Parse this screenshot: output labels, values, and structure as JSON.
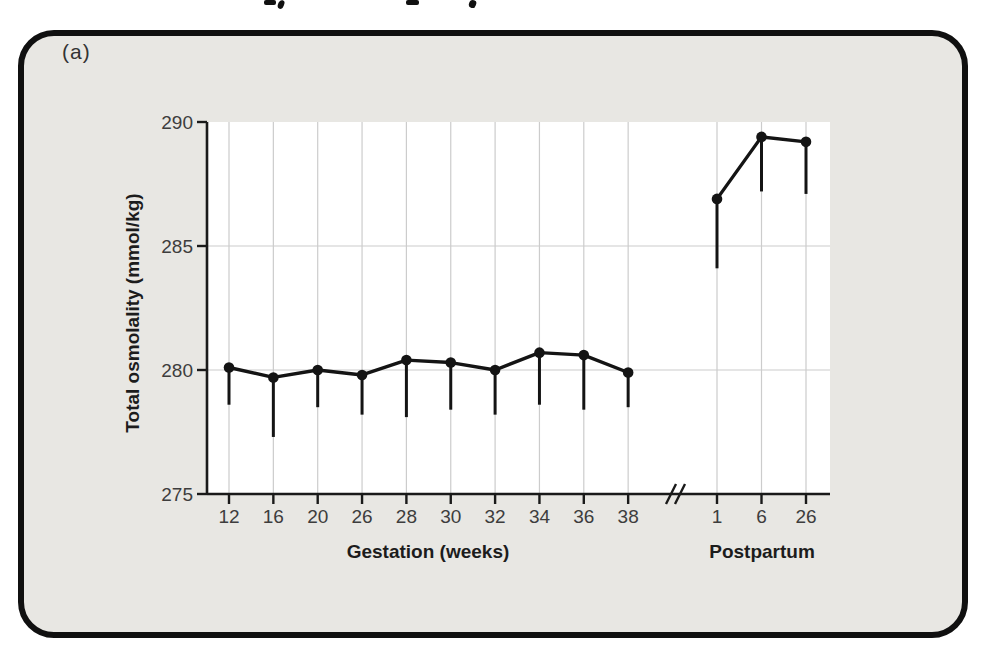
{
  "figure": {
    "panel_label": "(a)"
  },
  "chart_data": {
    "type": "line",
    "title": "",
    "ylabel": "Total osmolality (mmol/kg)",
    "ylim": [
      275,
      290
    ],
    "yticks": [
      290,
      285,
      280,
      275
    ],
    "grid_y": [
      285,
      280
    ],
    "grid_vertical": true,
    "legend": false,
    "axis_break_between_sections": true,
    "error_bars": "lower only, no caps",
    "sections": [
      {
        "name": "gestation",
        "xlabel": "Gestation (weeks)",
        "categories": [
          "12",
          "16",
          "20",
          "26",
          "28",
          "30",
          "32",
          "34",
          "36",
          "38"
        ],
        "values": [
          280.1,
          279.7,
          280.0,
          279.8,
          280.4,
          280.3,
          280.0,
          280.7,
          280.6,
          279.9
        ],
        "error_low": [
          278.6,
          277.3,
          278.5,
          278.2,
          278.1,
          278.4,
          278.2,
          278.6,
          278.4,
          278.5
        ]
      },
      {
        "name": "postpartum",
        "xlabel": "Postpartum",
        "categories": [
          "1",
          "6",
          "26"
        ],
        "values": [
          286.9,
          289.4,
          289.2
        ],
        "error_low": [
          284.1,
          287.2,
          287.1
        ]
      }
    ],
    "colors": {
      "frame_fill": "#e8e7e3",
      "frame_border": "#101010",
      "plot_bg": "#ffffff",
      "grid": "#cccccc",
      "axis": "#1a1a1a",
      "data": "#141414",
      "tick_text": "#3d3d3d"
    }
  }
}
